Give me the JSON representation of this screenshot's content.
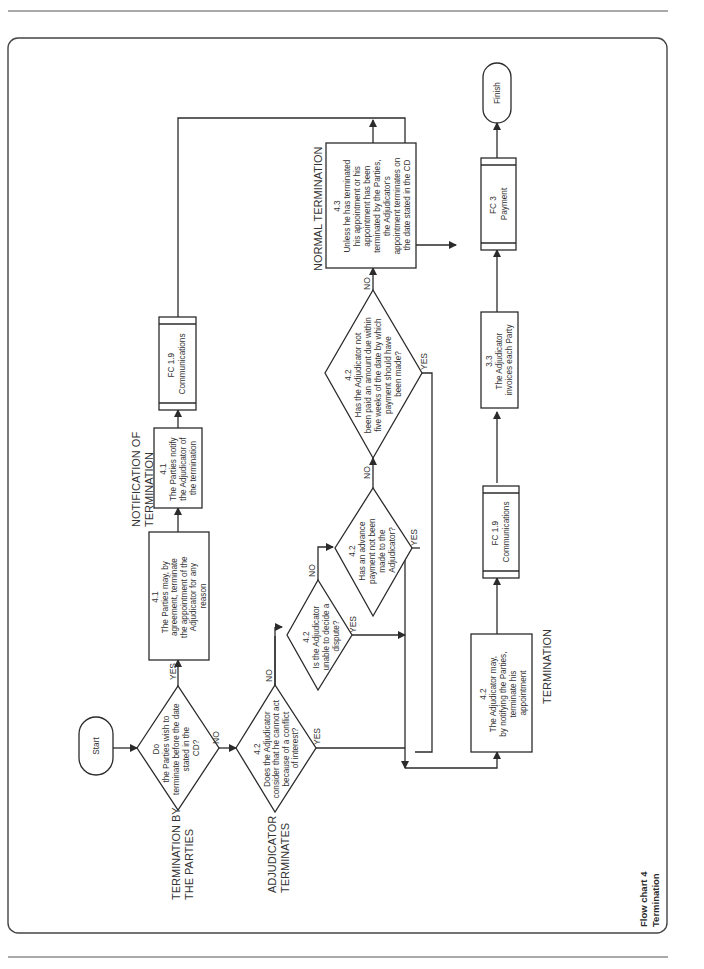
{
  "caption": {
    "line1": "Flow chart 4",
    "line2": "Termination"
  },
  "sections": {
    "termination_by_parties": [
      "TERMINATION BY",
      "THE PARTIES"
    ],
    "adjudicator_terminates": [
      "ADJUDICATOR",
      "TERMINATES"
    ],
    "notification": [
      "NOTIFICATION OF",
      "TERMINATION"
    ],
    "normal_termination": [
      "NORMAL TERMINATION"
    ],
    "termination": [
      "TERMINATION"
    ]
  },
  "nodes": {
    "start": "Start",
    "finish": "Finish",
    "d1": [
      "Do",
      "the Parties wish to",
      "terminate before the date",
      "stated in the",
      "CD?"
    ],
    "d2": [
      "4.2",
      "Does the Adjudicator",
      "consider that he cannot act",
      "because of a conflict",
      "of interest?"
    ],
    "d3": [
      "4.2",
      "Is the Adjudicator",
      "unable to decide a",
      "dispute?"
    ],
    "d4": [
      "4.2",
      "Has an advance",
      "payment not been",
      "made to the",
      "Adjudicator?"
    ],
    "d5": [
      "4.2",
      "Has the Adjudicator not",
      "been paid an amount due within",
      "five weeks of the date by which",
      "payment should have",
      "been made?"
    ],
    "p41a": [
      "4.1",
      "The Parties may, by",
      "agreement, terminate",
      "the appointment of the",
      "Adjudicator for any",
      "reason"
    ],
    "p41b": [
      "4.1",
      "The Parties notify",
      "the Adjudicator of",
      "the termination"
    ],
    "fc19a": [
      "FC 1.9",
      "Communications"
    ],
    "p43": [
      "4.3",
      "Unless he has terminated",
      "his appointment or his",
      "appointment has been",
      "terminated by the Parties,",
      "the Adjudicator's",
      "appointment terminates on",
      "the date stated in the CD"
    ],
    "p42": [
      "4.2",
      "The Adjudicator may,",
      "by notifying the Parties,",
      "terminate his",
      "appointment"
    ],
    "fc19b": [
      "FC 1.9",
      "Communications"
    ],
    "p33": [
      "3.3",
      "The Adjudicator",
      "invoices each Party"
    ],
    "fc3": [
      "FC 3",
      "Payment"
    ]
  },
  "edge_labels": {
    "yes": "YES",
    "no": "NO"
  }
}
